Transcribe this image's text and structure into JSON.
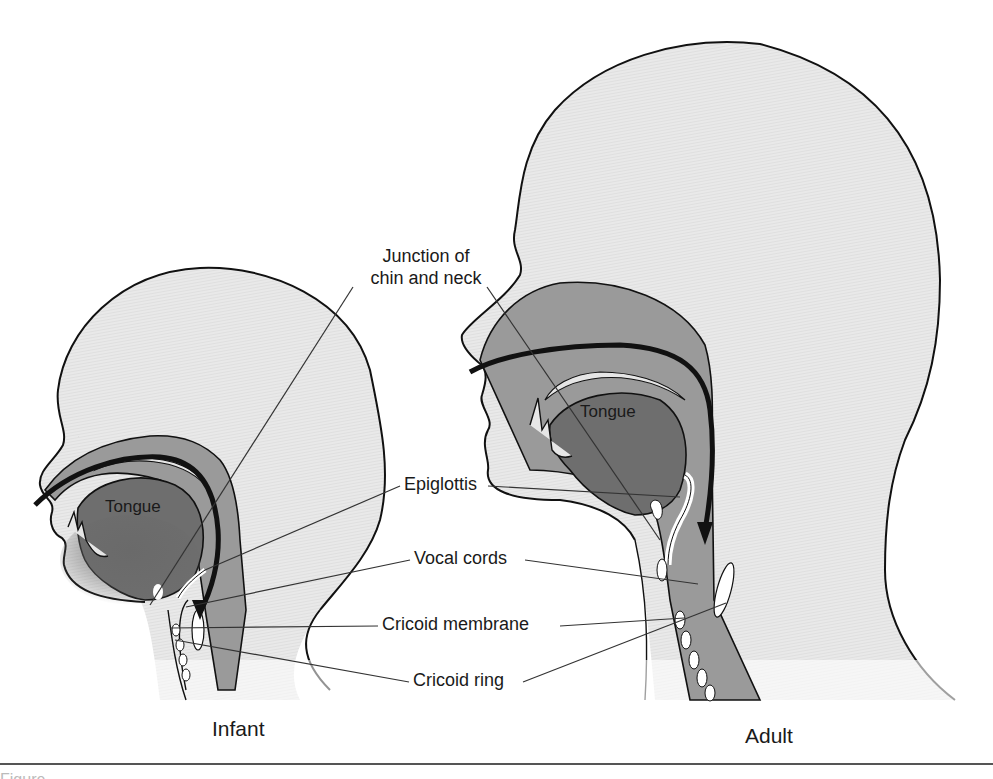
{
  "figure": {
    "type": "anatomical-comparison",
    "panels": [
      {
        "id": "infant",
        "caption": "Infant",
        "tongue_label": "Tongue"
      },
      {
        "id": "adult",
        "caption": "Adult",
        "tongue_label": "Tongue"
      }
    ],
    "labels": {
      "junction": "Junction of chin and neck",
      "junction_line1": "Junction of",
      "junction_line2": "chin and neck",
      "epiglottis": "Epiglottis",
      "vocal_cords": "Vocal cords",
      "cricoid_membrane": "Cricoid membrane",
      "cricoid_ring": "Cricoid ring"
    },
    "caption_partial": "Figure ..."
  },
  "colors": {
    "skin_fill": "#e6e6e6",
    "airway_fill": "#9a9a9a",
    "tongue_fill": "#6e6e6e",
    "outline": "#111111",
    "leader_line": "#333333"
  }
}
